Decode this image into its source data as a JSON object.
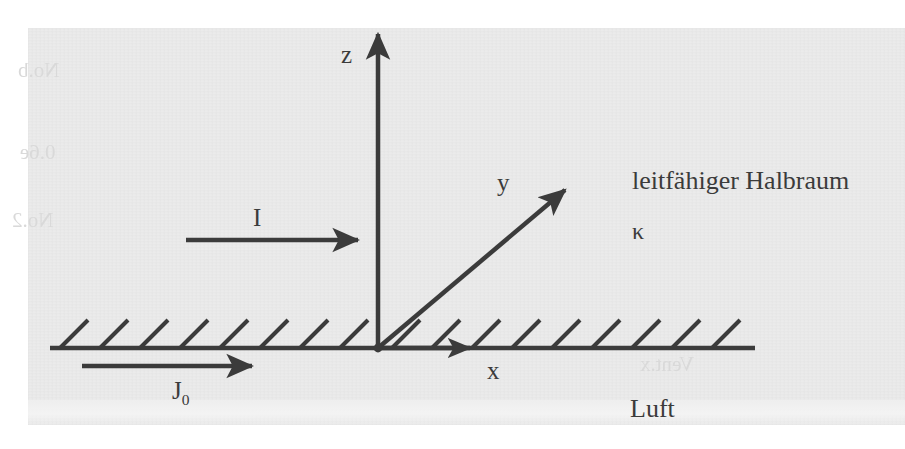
{
  "figure": {
    "kind": "physics-coordinate-diagram",
    "language": "de"
  },
  "axes": {
    "z": {
      "label": "z"
    },
    "y": {
      "label": "y"
    },
    "x": {
      "label": "x"
    }
  },
  "annotations": {
    "current": {
      "label": "I"
    },
    "surface_current": {
      "label": "J",
      "subscript": "0"
    },
    "conductivity": {
      "label": "κ"
    }
  },
  "regions": {
    "upper": {
      "label": "leitfähiger Halbraum"
    },
    "lower": {
      "label": "Luft"
    }
  },
  "ghost_text": {
    "a": "No.b",
    "b": "0.6e",
    "c": "No.2",
    "d": "Vent.x"
  },
  "colors": {
    "ink": "#3b3b3b",
    "paper": "#eeeeee",
    "page": "#ffffff",
    "ghost": "#d9d9d9"
  }
}
